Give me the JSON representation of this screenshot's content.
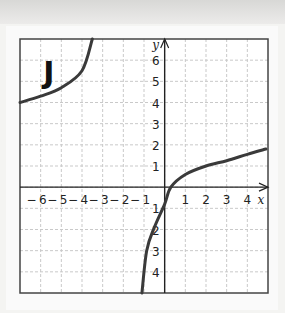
{
  "chart_data": {
    "type": "line",
    "title": "",
    "panel_label": "J",
    "xlabel": "x",
    "ylabel": "y",
    "xlim": [
      -7,
      5
    ],
    "ylim": [
      -5,
      7
    ],
    "grid": true,
    "x_ticks": [
      "-6",
      "-5",
      "-4",
      "-3",
      "-2",
      "-1",
      "1",
      "2",
      "3",
      "4"
    ],
    "y_ticks": [
      "6",
      "5",
      "4",
      "3",
      "2",
      "1",
      "1",
      "2",
      "3",
      "4"
    ],
    "y_tick_values": [
      6,
      5,
      4,
      3,
      2,
      1,
      -1,
      -2,
      -3,
      -4
    ],
    "x_tick_values": [
      -6,
      -5,
      -4,
      -3,
      -2,
      -1,
      1,
      2,
      3,
      4
    ],
    "series": [
      {
        "name": "left branch",
        "x": [
          -7,
          -6,
          -5,
          -4,
          -3.5
        ],
        "y": [
          4.0,
          4.3,
          4.7,
          5.5,
          7.0
        ]
      },
      {
        "name": "right branch",
        "x": [
          -1.1,
          -0.87,
          -0.5,
          0,
          0.3,
          1,
          2,
          3,
          4,
          4.9
        ],
        "y": [
          -5.0,
          -3.0,
          -1.9,
          -0.8,
          0,
          0.6,
          1.0,
          1.25,
          1.55,
          1.8
        ]
      }
    ],
    "curve_color": "#3a3a3a"
  }
}
